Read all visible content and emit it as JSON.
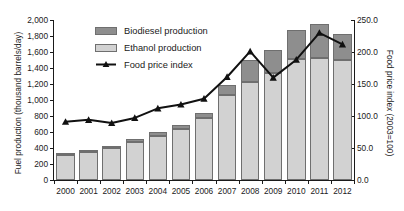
{
  "top_caption": "ALL-TEXT CUT OFF AT TOP EDGE OF FIGURE",
  "legend": {
    "items": [
      {
        "key": "biodiesel",
        "label": "Biodiesel production",
        "marker": "swatch",
        "color": "#8e8e8e"
      },
      {
        "key": "ethanol",
        "label": "Ethanol production",
        "marker": "swatch",
        "color": "#d2d2d2"
      },
      {
        "key": "food_price_index",
        "label": "Food price index",
        "marker": "line",
        "color": "#111111"
      }
    ]
  },
  "axes": {
    "left": {
      "title": "Fuel production (thousand barrels/day)",
      "ticks": [
        "0",
        "200",
        "400",
        "600",
        "800",
        "1,000",
        "1,200",
        "1,400",
        "1,600",
        "1,800",
        "2,000"
      ],
      "min": 0,
      "max": 2000,
      "step": 200
    },
    "right": {
      "title": "Food price index (2003=100)",
      "ticks": [
        "0.0",
        "50.0",
        "100.0",
        "150.0",
        "200.0",
        "250.0"
      ],
      "min": 0,
      "max": 250,
      "step": 50
    },
    "bottom": {
      "title": "",
      "ticks": [
        "2000",
        "2001",
        "2002",
        "2003",
        "2004",
        "2005",
        "2006",
        "2007",
        "2008",
        "2009",
        "2010",
        "2011",
        "2012"
      ]
    }
  },
  "chart_data": {
    "type": "bar",
    "title": "",
    "subtitle": "",
    "xlabel": "",
    "ylabel": "Fuel production (thousand barrels/day)",
    "y2label": "Food price index (2003=100)",
    "categories": [
      "2000",
      "2001",
      "2002",
      "2003",
      "2004",
      "2005",
      "2006",
      "2007",
      "2008",
      "2009",
      "2010",
      "2011",
      "2012"
    ],
    "ylim": [
      0,
      2000
    ],
    "y2lim": [
      0,
      250
    ],
    "grid": false,
    "legend_position": "upper-left-inside",
    "stacked": true,
    "series": [
      {
        "name": "Ethanol production",
        "axis": "left",
        "kind": "bar",
        "color": "#d2d2d2",
        "values": [
          310,
          345,
          395,
          470,
          555,
          635,
          780,
          1060,
          1230,
          1340,
          1510,
          1530,
          1500
        ]
      },
      {
        "name": "Biodiesel production",
        "axis": "left",
        "kind": "bar",
        "color": "#8e8e8e",
        "values": [
          15,
          20,
          30,
          40,
          45,
          55,
          60,
          125,
          265,
          280,
          370,
          420,
          330
        ]
      },
      {
        "name": "Total fuel production",
        "axis": "left",
        "kind": "bar-total",
        "color": "#8e8e8e",
        "values": [
          325,
          365,
          425,
          510,
          600,
          690,
          840,
          1185,
          1495,
          1620,
          1880,
          1950,
          1830
        ]
      },
      {
        "name": "Food price index",
        "axis": "right",
        "kind": "line",
        "color": "#111111",
        "values": [
          91,
          94,
          89,
          97,
          112,
          118,
          127,
          161,
          201,
          160,
          188,
          230,
          212
        ]
      }
    ]
  }
}
